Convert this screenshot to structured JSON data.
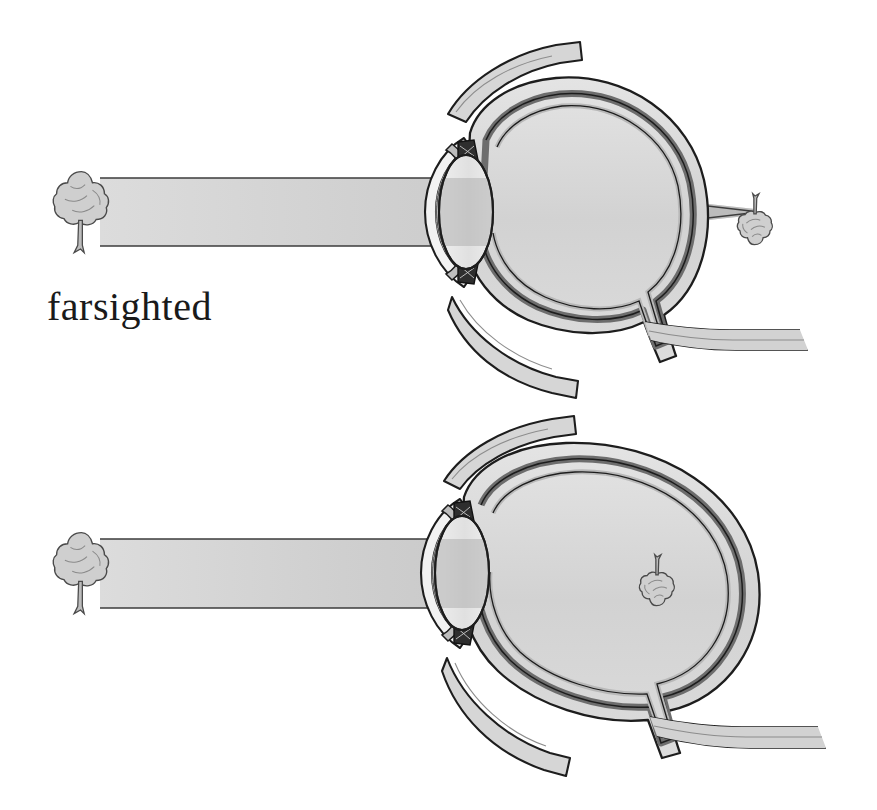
{
  "figure": {
    "background_color": "#ffffff",
    "ink_color": "#1a1a1a",
    "panel_count": 2
  },
  "panels": [
    {
      "id": "farsighted",
      "label": "farsighted",
      "condition": "hyperopia",
      "eyeball_shape": "axially short, vertically tall",
      "focal_point_location": "behind the retina, outside the eyeball",
      "object": {
        "name": "tree",
        "icon": "tree-icon",
        "orientation": "upright"
      },
      "image": {
        "name": "focused tree image",
        "icon": "inverted-tree-icon",
        "orientation": "inverted"
      },
      "light": {
        "name": "light beam",
        "fill_color": "#c9c9c9",
        "edge_color": "#4a4a4a"
      }
    },
    {
      "id": "nearsighted",
      "label": "nearsighted",
      "condition": "myopia",
      "eyeball_shape": "axially elongated",
      "focal_point_location": "in front of the retina, inside the vitreous",
      "object": {
        "name": "tree",
        "icon": "tree-icon",
        "orientation": "upright"
      },
      "image": {
        "name": "focused tree image",
        "icon": "inverted-tree-icon",
        "orientation": "inverted"
      },
      "light": {
        "name": "light beam",
        "fill_color": "#c9c9c9",
        "edge_color": "#4a4a4a"
      }
    }
  ],
  "anatomy": {
    "parts": [
      {
        "name": "sclera",
        "fill_color": "#d8d8d8"
      },
      {
        "name": "choroid",
        "fill_color": "#9a9a9a"
      },
      {
        "name": "retina",
        "fill_color": "#e2e2e2"
      },
      {
        "name": "cornea",
        "fill_color": "#f0f0f0"
      },
      {
        "name": "lens",
        "fill_color": "#e6e6e6"
      },
      {
        "name": "ciliary-body",
        "fill_color": "#3a3a3a"
      },
      {
        "name": "iris",
        "fill_color": "#b5b5b5"
      },
      {
        "name": "optic-nerve",
        "fill_color": "#cccccc"
      },
      {
        "name": "extraocular-muscle",
        "fill_color": "#d4d4d4"
      },
      {
        "name": "vitreous",
        "fill_color": "#ffffff"
      }
    ]
  },
  "colors": {
    "background": "#ffffff",
    "outline": "#1a1a1a",
    "sclera": "#d8d8d8",
    "choroid": "#9a9a9a",
    "retina": "#e6e6e6",
    "lens": "#e6e6e6",
    "beam": "#c9c9c9",
    "beam_dark": "#a8a8a8",
    "muscle": "#d4d4d4",
    "ciliary": "#303030"
  }
}
